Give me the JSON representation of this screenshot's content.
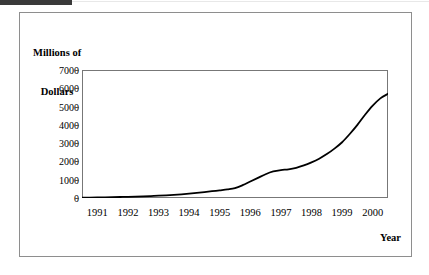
{
  "figure": {
    "accent_color": "#3a3a3a",
    "border_color": "#8e8e8e",
    "background": "#ffffff"
  },
  "chart_data": {
    "type": "line",
    "title": "",
    "subtitle": "",
    "xlabel": "Year",
    "ylabel": "Millions of Dollars",
    "ylabel_line1": "Millions of",
    "ylabel_line2": "Dollars",
    "ylim": [
      0,
      7000
    ],
    "xlim": [
      1991,
      2001
    ],
    "grid": false,
    "legend": "none",
    "line_color": "#000000",
    "line_width": 1.8,
    "y_ticks": [
      7000,
      6000,
      5000,
      4000,
      3000,
      2000,
      1000,
      0
    ],
    "y_tick_labels": [
      "7000",
      "6000",
      "5000",
      "4000",
      "3000",
      "2000",
      "1000",
      "0"
    ],
    "x_tick_labels": [
      "1991",
      "1992",
      "1993",
      "1994",
      "1995",
      "1996",
      "1997",
      "1998",
      "1999",
      "2000"
    ],
    "x_minor_tick_interval": "monthly",
    "x_minor_tick_count": 120,
    "series": [
      {
        "name": "Millions of Dollars",
        "x": [
          1991.0,
          1991.25,
          1991.5,
          1991.75,
          1992.0,
          1992.25,
          1992.5,
          1992.75,
          1993.0,
          1993.25,
          1993.5,
          1993.75,
          1994.0,
          1994.25,
          1994.5,
          1994.75,
          1995.0,
          1995.25,
          1995.5,
          1995.75,
          1996.0,
          1996.25,
          1996.5,
          1996.75,
          1997.0,
          1997.25,
          1997.5,
          1997.75,
          1998.0,
          1998.25,
          1998.5,
          1998.75,
          1999.0,
          1999.25,
          1999.5,
          1999.75,
          2000.0,
          2000.25,
          2000.5,
          2000.75,
          2001.0
        ],
        "values": [
          20,
          25,
          30,
          36,
          45,
          55,
          65,
          78,
          92,
          108,
          125,
          145,
          170,
          200,
          235,
          275,
          320,
          370,
          420,
          470,
          540,
          700,
          900,
          1100,
          1300,
          1450,
          1530,
          1570,
          1650,
          1780,
          1950,
          2150,
          2400,
          2700,
          3050,
          3500,
          4000,
          4550,
          5050,
          5450,
          5700
        ]
      }
    ],
    "annotations": []
  }
}
